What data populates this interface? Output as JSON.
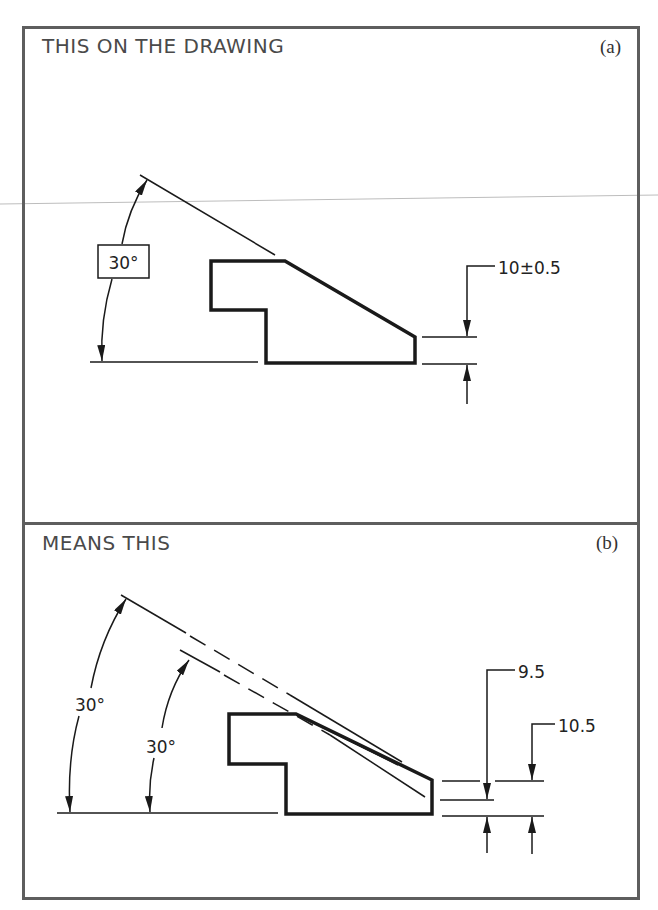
{
  "figure": {
    "panel_a": {
      "title": "THIS ON THE DRAWING",
      "label": "(a)",
      "angle_dimension": "30°",
      "angle_is_basic_boxed": true,
      "linear_dimension": "10±0.5"
    },
    "panel_b": {
      "title": "MEANS THIS",
      "label": "(b)",
      "outer_angle": "30°",
      "inner_angle": "30°",
      "min_dimension": "9.5",
      "max_dimension": "10.5"
    },
    "colors": {
      "frame": "#5e5e5e",
      "linework": "#1a1a1a",
      "text": "#4a4a4a"
    }
  }
}
